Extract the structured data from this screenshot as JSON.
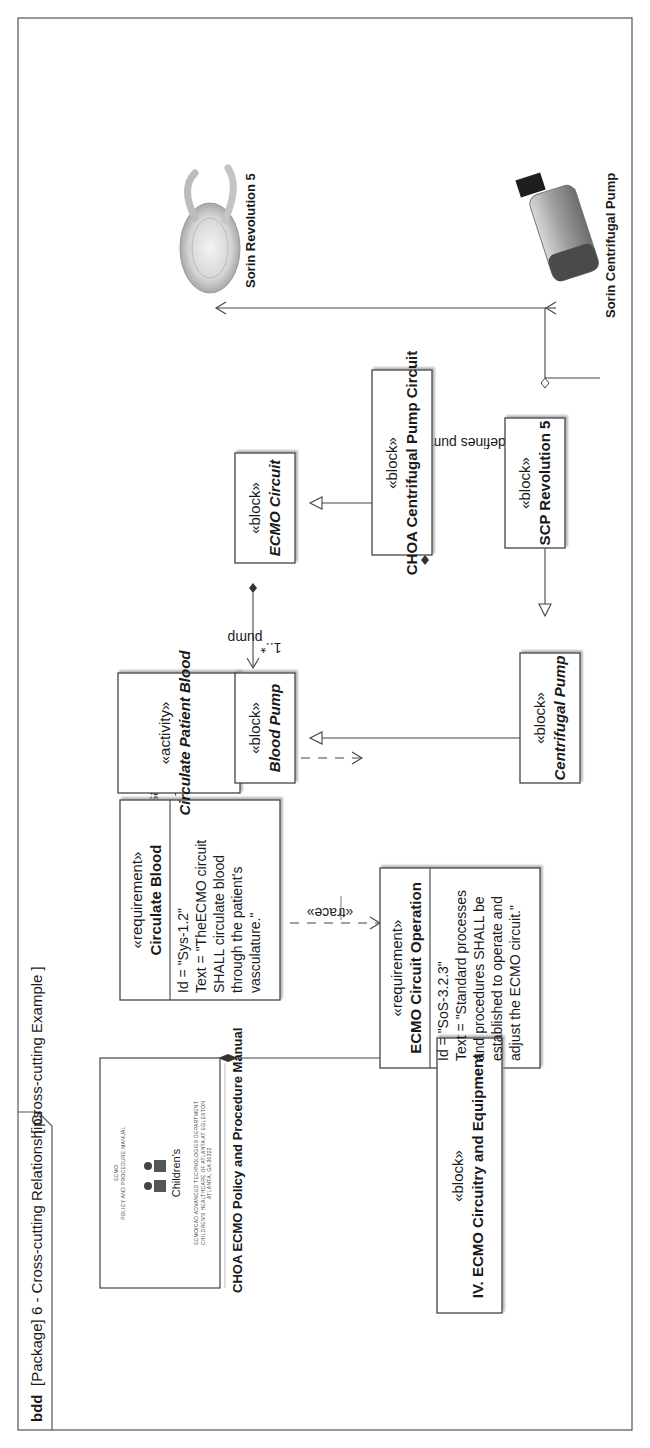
{
  "frame": {
    "kind": "bdd",
    "title": "[Package] 6 - Cross-cutting Relationships",
    "diagram_name": "[ Cross-cutting Example ]"
  },
  "nodes": {
    "circulate_patient_blood": {
      "stereotype": "«activity»",
      "name": "Circulate Patient Blood"
    },
    "blood_pump": {
      "stereotype": "«block»",
      "name": "Blood Pump"
    },
    "ecmo_circuit": {
      "stereotype": "«block»",
      "name": "ECMO Circuit"
    },
    "choa_circuit": {
      "stereotype": "«block»",
      "name": "CHOA Centrifugal Pump Circuit"
    },
    "centrifugal_pump": {
      "stereotype": "«block»",
      "name": "Centrifugal Pump"
    },
    "scp_revolution": {
      "stereotype": "«block»",
      "name": "SCP Revolution 5"
    },
    "circulate_blood": {
      "stereotype": "«requirement»",
      "name": "Circulate Blood",
      "lines": [
        "Id = \"Sys-1.2\"",
        "Text = \"TheECMO circuit",
        "SHALL circulate blood",
        "through the patient's",
        "vasculature.\""
      ]
    },
    "ecmo_operation": {
      "stereotype": "«requirement»",
      "name": "ECMO Circuit Operation",
      "lines": [
        "Id = \"SoS-3.2.3\"",
        "Text = \"Standard processes",
        "and procedures SHALL be",
        "established to operate and",
        "adjust the ECMO circuit.\""
      ]
    },
    "ecmo_circuitry": {
      "stereotype": "«block»",
      "name": "IV. ECMO Circuitry and Equipment"
    }
  },
  "relationships": {
    "satisfy": "«satisfy»",
    "allocate": "«allocate»",
    "trace_1": "«trace»",
    "trace_2": "«trace»",
    "pump_role": "pump",
    "pump_multiplicity": "1..*",
    "scp_role": "pump",
    "scp_constraint": "{redefines pump}"
  },
  "images": {
    "manual_caption": "CHOA ECMO Policy and Procedure Manual",
    "manual_doc": {
      "line1": "ECMO",
      "line2": "POLICY AND PROCEDURE MANUAL",
      "logo": "Children's",
      "footer1": "ECMO/CAD ADVANCED TECHNOLOGIES DEPARTMENT",
      "footer2": "CHILDREN'S HEALTHCARE OF ATLANTA AT EGLESTON",
      "footer3": "ATLANTA, GA  30322"
    },
    "revolution_caption": "Sorin Revolution 5",
    "centrifugal_caption": "Sorin Centrifugal Pump"
  }
}
